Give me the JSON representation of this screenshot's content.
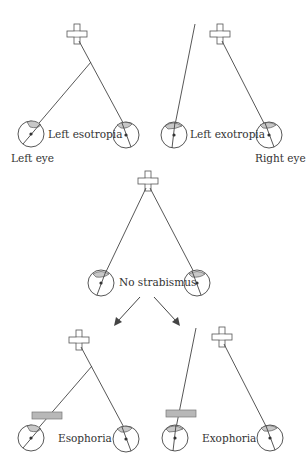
{
  "figure": {
    "type": "strabismus-vs-phoria diagram",
    "colors": {
      "line": "#444444",
      "lens": "#c8c8c8",
      "occluder": "#b8b8b8",
      "text": "#333333"
    }
  },
  "panels": {
    "left_esotropia": {
      "label": "Left esotropia"
    },
    "left_exotropia": {
      "label": "Left exotropia"
    },
    "no_strabismus": {
      "label": "No strabismus"
    },
    "esophoria": {
      "label": "Esophoria"
    },
    "exophoria": {
      "label": "Exophoria"
    }
  },
  "eye_labels": {
    "left": "Left eye",
    "right": "Right eye"
  }
}
